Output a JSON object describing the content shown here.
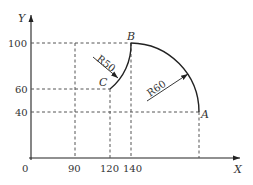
{
  "diagram": {
    "axes": {
      "x_label": "X",
      "y_label": "Y",
      "origin_label": "0"
    },
    "x_ticks": [
      "90",
      "120",
      "140"
    ],
    "y_ticks": [
      "100",
      "60",
      "40"
    ],
    "points": {
      "A": "A",
      "B": "B",
      "C": "C"
    },
    "radii": {
      "CB": "R50",
      "BA": "R60"
    },
    "colors": {
      "line": "#222222",
      "dash": "#555555",
      "text": "#333333"
    }
  }
}
